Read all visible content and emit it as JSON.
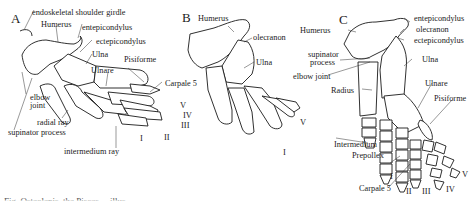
{
  "figure": {
    "panels": [
      {
        "id": "A",
        "labels": {
          "girdle": "endoskeletal shoulder girdle",
          "humerus": "Humerus",
          "entepicondylus": "entepicondylus",
          "ectepicondylus": "ectepicondylus",
          "ulna": "Ulna",
          "ulnare": "Ulnare",
          "pisiforme": "Pisiforme",
          "carpale5": "Carpale 5",
          "elbow_joint_1": "elbow",
          "elbow_joint_2": "joint",
          "radial_ray": "radial ray",
          "supinator_process": "supinator process",
          "intermedium_ray": "intermedium ray"
        },
        "digits": [
          "V",
          "IV",
          "III",
          "II",
          "I"
        ]
      },
      {
        "id": "B",
        "labels": {
          "humerus": "Humerus",
          "olecranon": "olecranon",
          "ulna": "Ulna"
        },
        "digits": [
          "V",
          "I"
        ]
      },
      {
        "id": "C",
        "labels": {
          "humerus": "Humerus",
          "entepicondylus": "entepicondylus",
          "olecranon": "olecranon",
          "ectepicondylus": "ectepicondylus",
          "supinator_1": "supinator",
          "supinator_2": "process",
          "elbow_joint": "elbow joint",
          "ulna": "Ulna",
          "radius": "Radius",
          "ulnare": "Ulnare",
          "pisiforme": "Pisiforme",
          "intermedium": "Intermedium",
          "prepollex": "Prepollex",
          "carpale5": "Carpale 5"
        },
        "digits": [
          "I",
          "II",
          "III",
          "IV",
          "V"
        ]
      }
    ],
    "caption_partial": "Fig. Osteolepis, the Pisces ... illus ... ... ..."
  }
}
